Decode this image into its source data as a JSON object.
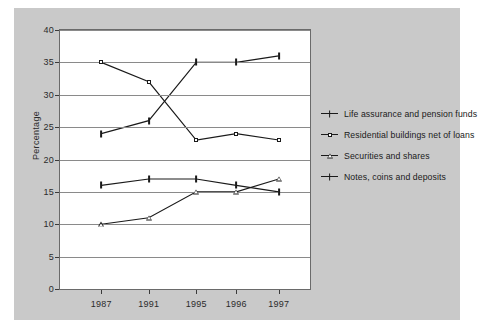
{
  "chart_data": {
    "type": "line",
    "title": "",
    "xlabel": "",
    "ylabel": "Percentage",
    "categories": [
      "1987",
      "1991",
      "1995",
      "1996",
      "1997"
    ],
    "ylim": [
      0,
      40
    ],
    "ytick_step": 5,
    "yticks": [
      "0",
      "5",
      "10",
      "15",
      "20",
      "25",
      "30",
      "35",
      "40"
    ],
    "grid": true,
    "legend_position": "right",
    "series": [
      {
        "name": "Life assurance and pension funds",
        "marker": "dash-marker",
        "values": [
          24,
          26,
          35,
          35,
          36
        ]
      },
      {
        "name": "Residential buildings net of loans",
        "marker": "open-square-marker",
        "values": [
          35,
          32,
          23,
          24,
          23
        ]
      },
      {
        "name": "Securities and shares",
        "marker": "open-triangle-marker",
        "values": [
          10,
          11,
          15,
          15,
          17
        ]
      },
      {
        "name": "Notes, coins and deposits",
        "marker": "cross-dash-marker",
        "values": [
          16,
          17,
          17,
          16,
          15
        ]
      }
    ],
    "colors": {
      "line": "#1a1a1a",
      "grid": "#8a8a8a",
      "plot_background": "#ffffff",
      "figure_background": "#c9c9c9",
      "page_background": "#ffffff",
      "text": "#2b2b2b"
    }
  },
  "axis": {
    "y_label": "Percentage"
  }
}
